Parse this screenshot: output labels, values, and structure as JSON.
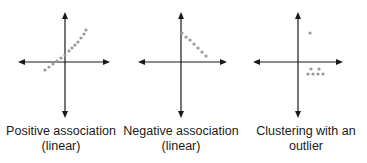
{
  "colors": {
    "axis": "#1a1a1a",
    "dot": "#9a9a9a",
    "text": "#1a1a1a"
  },
  "panels": [
    {
      "id": "positive",
      "caption_line1": "Positive association",
      "caption_line2": "(linear)",
      "axis": {
        "cx": 65,
        "cy": 62,
        "left": 18,
        "right": 110,
        "top": 12,
        "bottom": 118
      },
      "dots": [
        [
          45,
          70
        ],
        [
          49,
          67
        ],
        [
          53,
          64
        ],
        [
          57,
          61
        ],
        [
          61,
          58
        ],
        [
          65,
          55
        ],
        [
          69,
          51
        ],
        [
          72,
          48
        ],
        [
          75,
          45
        ],
        [
          78,
          42
        ],
        [
          81,
          38
        ],
        [
          84,
          34
        ],
        [
          86,
          30
        ]
      ]
    },
    {
      "id": "negative",
      "caption_line1": "Negative association",
      "caption_line2": "(linear)",
      "axis": {
        "cx": 61,
        "cy": 62,
        "left": 18,
        "right": 107,
        "top": 12,
        "bottom": 118
      },
      "dots": [
        [
          62,
          33
        ],
        [
          66,
          37
        ],
        [
          70,
          40
        ],
        [
          74,
          44
        ],
        [
          78,
          48
        ],
        [
          82,
          52
        ],
        [
          86,
          56
        ]
      ]
    },
    {
      "id": "cluster",
      "caption_line1": "Clustering with an",
      "caption_line2": "outlier",
      "axis": {
        "cx": 53,
        "cy": 62,
        "left": 8,
        "right": 98,
        "top": 12,
        "bottom": 118
      },
      "dots": [
        [
          65,
          33
        ],
        [
          66,
          69
        ],
        [
          74,
          69
        ],
        [
          63,
          74
        ],
        [
          68,
          74
        ],
        [
          73,
          74
        ],
        [
          78,
          74
        ]
      ]
    }
  ]
}
